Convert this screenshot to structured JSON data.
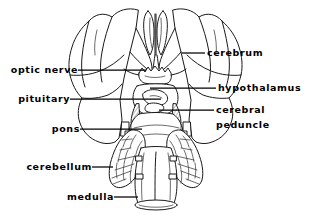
{
  "figure": {
    "width": 311,
    "height": 218,
    "background": "#ffffff",
    "ink_color": "#1a1a1a"
  },
  "labels": {
    "optic_nerve": "optic nerve",
    "pituitary": "pituitary",
    "pons": "pons",
    "cerebellum": "cerebellum",
    "medulla": "medulla",
    "cerebrum": "cerebrum",
    "hypothalamus": "hypothalamus",
    "cerebral": "cerebral",
    "peduncle": "peduncle"
  },
  "structures": [
    {
      "name": "cerebrum",
      "side": "right",
      "label": "cerebrum"
    },
    {
      "name": "hypothalamus",
      "side": "right",
      "label": "hypothalamus"
    },
    {
      "name": "cerebral-peduncle",
      "side": "right",
      "label": "cerebral peduncle"
    },
    {
      "name": "optic-nerve",
      "side": "left",
      "label": "optic nerve"
    },
    {
      "name": "pituitary",
      "side": "left",
      "label": "pituitary"
    },
    {
      "name": "pons",
      "side": "left",
      "label": "pons"
    },
    {
      "name": "cerebellum",
      "side": "left",
      "label": "cerebellum"
    },
    {
      "name": "medulla",
      "side": "left",
      "label": "medulla"
    }
  ]
}
